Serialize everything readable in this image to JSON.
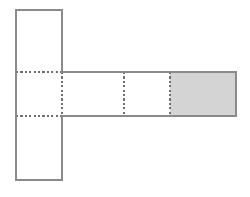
{
  "figure": {
    "background_color": "#ffffff",
    "stroke_color": "#8a8a8a",
    "fold_line_color": "#6f6f6f",
    "shaded_fill_color": "#d4d4d4",
    "unshaded_fill_color": "#ffffff",
    "stroke_width": 1.4,
    "fold_stroke_width": 1.2,
    "fold_dash_pattern": "2.2 2.2",
    "cell_size_px": 54,
    "canvas": {
      "width": 250,
      "height": 197
    },
    "grid": {
      "column_x": [
        16,
        62,
        124,
        170,
        236
      ],
      "row_y": [
        10,
        72,
        116,
        180
      ]
    },
    "cells": [
      {
        "id": "cell-top",
        "label": "top square",
        "x": 16,
        "y": 10,
        "width": 46,
        "height": 62,
        "shaded": false,
        "fill": "#ffffff"
      },
      {
        "id": "cell-center-left",
        "label": "center left square",
        "x": 16,
        "y": 72,
        "width": 46,
        "height": 44,
        "shaded": false,
        "fill": "#ffffff"
      },
      {
        "id": "cell-center-mid",
        "label": "center middle square",
        "x": 62,
        "y": 72,
        "width": 62,
        "height": 44,
        "shaded": false,
        "fill": "#ffffff"
      },
      {
        "id": "cell-center-right",
        "label": "center right square",
        "x": 124,
        "y": 72,
        "width": 46,
        "height": 44,
        "shaded": false,
        "fill": "#ffffff"
      },
      {
        "id": "cell-shaded-end",
        "label": "shaded end square",
        "x": 170,
        "y": 72,
        "width": 66,
        "height": 44,
        "shaded": true,
        "fill": "#d4d4d4"
      },
      {
        "id": "cell-bottom",
        "label": "bottom square",
        "x": 16,
        "y": 116,
        "width": 46,
        "height": 64,
        "shaded": false,
        "fill": "#ffffff"
      }
    ],
    "outline_path": "M 16 10 L 62 10 L 62 72 L 236 72 L 236 116 L 62 116 L 62 180 L 16 180 Z",
    "solid_segments": [
      {
        "id": "outline-top-edge",
        "x1": 16,
        "y1": 10,
        "x2": 62,
        "y2": 10
      },
      {
        "id": "outline-top-left-edge",
        "x1": 16,
        "y1": 10,
        "x2": 16,
        "y2": 180
      },
      {
        "id": "outline-vertical-right-upper",
        "x1": 62,
        "y1": 10,
        "x2": 62,
        "y2": 72
      },
      {
        "id": "outline-strip-top-edge",
        "x1": 62,
        "y1": 72,
        "x2": 236,
        "y2": 72
      },
      {
        "id": "outline-strip-right-edge",
        "x1": 236,
        "y1": 72,
        "x2": 236,
        "y2": 116
      },
      {
        "id": "outline-strip-bottom-edge",
        "x1": 62,
        "y1": 116,
        "x2": 236,
        "y2": 116
      },
      {
        "id": "outline-vertical-right-lower",
        "x1": 62,
        "y1": 116,
        "x2": 62,
        "y2": 180
      },
      {
        "id": "outline-bottom-edge",
        "x1": 16,
        "y1": 180,
        "x2": 62,
        "y2": 180
      }
    ],
    "fold_lines": [
      {
        "id": "fold-horizontal-upper",
        "orientation": "horizontal",
        "x1": 16,
        "y1": 72,
        "x2": 62,
        "y2": 72
      },
      {
        "id": "fold-horizontal-lower",
        "orientation": "horizontal",
        "x1": 16,
        "y1": 116,
        "x2": 62,
        "y2": 116
      },
      {
        "id": "fold-vertical-junction",
        "orientation": "vertical",
        "x1": 62,
        "y1": 72,
        "x2": 62,
        "y2": 116
      },
      {
        "id": "fold-vertical-middle",
        "orientation": "vertical",
        "x1": 124,
        "y1": 72,
        "x2": 124,
        "y2": 116
      },
      {
        "id": "fold-vertical-shaded",
        "orientation": "vertical",
        "x1": 170,
        "y1": 72,
        "x2": 170,
        "y2": 116
      }
    ]
  }
}
